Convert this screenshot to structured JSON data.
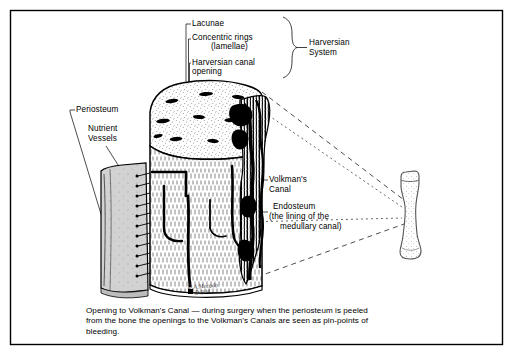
{
  "figure": {
    "title_hidden": "Bone microstructure cutaway with Harversian system",
    "border_color": "#000000",
    "ink_color": "#000000",
    "periosteum_fill": "#cfcfcf",
    "bone_fill": "#ffffff"
  },
  "labels": {
    "lacunae": "Lacunae",
    "concentric_rings_line1": "Concentric rings",
    "concentric_rings_line2": "(lamellae)",
    "harversian_canal_opening_line1": "Harversian canal",
    "harversian_canal_opening_line2": "opening",
    "harversian_system_line1": "Harversian",
    "harversian_system_line2": "System",
    "periosteum": "Periosteum",
    "nutrient_vessels_line1": "Nutrient",
    "nutrient_vessels_line2": "Vessels",
    "volkmans_canal_line1": "Volkman's",
    "volkmans_canal_line2": "Canal",
    "endosteum_line1": "Endosteum",
    "endosteum_line2": "(the lining of the",
    "endosteum_line3": "medullary canal)"
  },
  "caption": {
    "line1": "Opening to Volkman's Canal — during surgery when the periosteum is peeled",
    "line2": "from the bone the openings to the Volkman's Canals are seen as pin-points of",
    "line3": "bleeding."
  },
  "signature": {
    "line1": "D.A.Mecado",
    "line2": "D.P.M."
  }
}
